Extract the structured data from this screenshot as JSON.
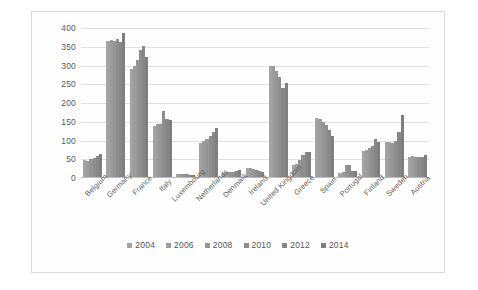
{
  "chart_data": {
    "type": "bar",
    "title": "",
    "subtitle": "",
    "xlabel": "",
    "ylabel": "",
    "ylim": [
      0,
      400
    ],
    "ytick_step": 50,
    "yticks": [
      "400",
      "350",
      "300",
      "250",
      "200",
      "150",
      "100",
      "50",
      "0"
    ],
    "grid": true,
    "legend_position": "bottom",
    "categories": [
      "Belgium",
      "Germany",
      "France",
      "Italy",
      "Luxembourg",
      "Netherlands",
      "Denmark",
      "Ireland",
      "United Kingdom",
      "Greece",
      "Spain",
      "Portugal",
      "Finland",
      "Sweden",
      "Austria"
    ],
    "series": [
      {
        "name": "2004",
        "color": "#a3a3a3",
        "values": [
          48,
          365,
          292,
          138,
          10,
          93,
          14,
          27,
          300,
          35,
          161,
          14,
          72,
          96,
          57
        ]
      },
      {
        "name": "2006",
        "color": "#9c9c9c",
        "values": [
          46,
          367,
          300,
          143,
          11,
          99,
          15,
          27,
          298,
          38,
          157,
          16,
          75,
          95,
          58
        ]
      },
      {
        "name": "2008",
        "color": "#959595",
        "values": [
          50,
          365,
          315,
          145,
          11,
          104,
          16,
          24,
          285,
          49,
          150,
          35,
          81,
          93,
          57
        ]
      },
      {
        "name": "2010",
        "color": "#8e8e8e",
        "values": [
          53,
          372,
          341,
          178,
          11,
          113,
          17,
          22,
          270,
          62,
          142,
          34,
          85,
          100,
          56
        ]
      },
      {
        "name": "2012",
        "color": "#878787",
        "values": [
          60,
          363,
          352,
          157,
          9,
          124,
          18,
          19,
          240,
          70,
          128,
          20,
          103,
          122,
          55
        ]
      },
      {
        "name": "2014",
        "color": "#7f7f7f",
        "values": [
          63,
          388,
          324,
          156,
          7,
          134,
          21,
          17,
          254,
          70,
          113,
          19,
          97,
          169,
          62
        ]
      }
    ]
  }
}
